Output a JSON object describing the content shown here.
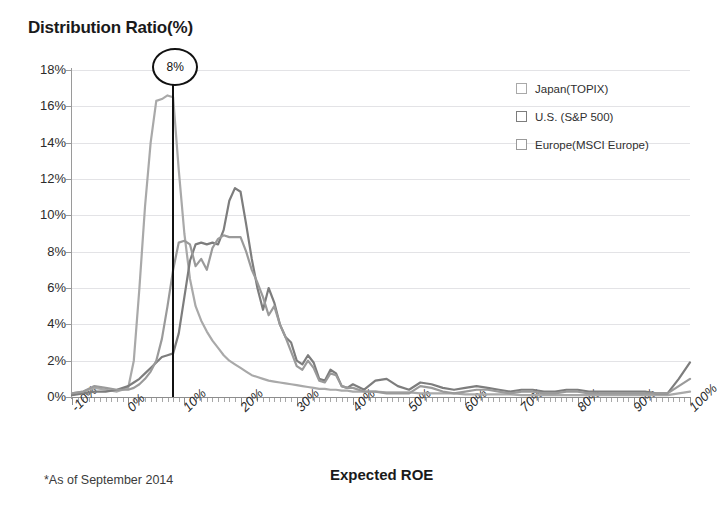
{
  "axes": {
    "y_title": "Distribution Ratio(%)",
    "x_title": "Expected ROE",
    "y_ticks": [
      "0%",
      "2%",
      "4%",
      "6%",
      "8%",
      "10%",
      "12%",
      "14%",
      "16%",
      "18%"
    ],
    "x_ticks": [
      "-10%",
      "0%",
      "10%",
      "20%",
      "30%",
      "40%",
      "50%",
      "60%",
      "70%",
      "80%",
      "90%",
      "100%"
    ]
  },
  "footnote": "*As of September 2014",
  "callout": {
    "label": "8%",
    "x_value": 8
  },
  "legend": {
    "items": [
      {
        "label": "Japan(TOPIX)",
        "color": "#a9a9a9"
      },
      {
        "label": "U.S. (S&P 500)",
        "color": "#7d7d7d"
      },
      {
        "label": "Europe(MSCI Europe)",
        "color": "#9a9a9a"
      }
    ]
  },
  "chart_data": {
    "type": "line",
    "title": "Distribution Ratio(%)",
    "xlabel": "Expected ROE",
    "ylabel": "Distribution Ratio(%)",
    "xlim": [
      -10,
      100
    ],
    "ylim": [
      0,
      18
    ],
    "grid": true,
    "legend_position": "top-right",
    "annotations": [
      {
        "text": "8%",
        "x": 8,
        "type": "vertical-line-callout"
      },
      {
        "text": "*As of September 2014",
        "type": "footnote"
      }
    ],
    "x": [
      -10,
      -8,
      -6,
      -4,
      -2,
      0,
      1,
      2,
      3,
      4,
      5,
      6,
      7,
      8,
      9,
      10,
      11,
      12,
      13,
      14,
      15,
      16,
      17,
      18,
      19,
      20,
      21,
      22,
      23,
      24,
      25,
      26,
      27,
      28,
      29,
      30,
      31,
      32,
      33,
      34,
      35,
      36,
      37,
      38,
      39,
      40,
      42,
      44,
      46,
      48,
      50,
      52,
      54,
      56,
      58,
      60,
      62,
      64,
      66,
      68,
      70,
      72,
      74,
      76,
      78,
      80,
      82,
      84,
      86,
      88,
      90,
      92,
      94,
      96,
      98,
      100
    ],
    "series": [
      {
        "name": "Japan(TOPIX)",
        "color": "#a9a9a9",
        "values": [
          0.2,
          0.3,
          0.5,
          0.4,
          0.3,
          0.5,
          2.0,
          6.0,
          10.5,
          14.0,
          16.3,
          16.4,
          16.6,
          16.5,
          12.5,
          9.0,
          6.5,
          5.0,
          4.2,
          3.6,
          3.1,
          2.7,
          2.3,
          2.0,
          1.8,
          1.6,
          1.4,
          1.2,
          1.1,
          1.0,
          0.9,
          0.85,
          0.8,
          0.75,
          0.7,
          0.65,
          0.6,
          0.55,
          0.5,
          0.45,
          0.45,
          0.4,
          0.4,
          0.35,
          0.35,
          0.3,
          0.3,
          0.3,
          0.25,
          0.25,
          0.25,
          0.2,
          0.2,
          0.2,
          0.2,
          0.15,
          0.15,
          0.15,
          0.15,
          0.15,
          0.1,
          0.1,
          0.1,
          0.1,
          0.1,
          0.1,
          0.1,
          0.1,
          0.1,
          0.1,
          0.1,
          0.1,
          0.1,
          0.1,
          0.2,
          0.3
        ]
      },
      {
        "name": "U.S. (S&P 500)",
        "color": "#7d7d7d",
        "values": [
          0.1,
          0.2,
          0.3,
          0.3,
          0.4,
          0.6,
          0.8,
          1.0,
          1.3,
          1.6,
          1.9,
          2.2,
          2.3,
          2.4,
          3.5,
          5.5,
          7.5,
          8.4,
          8.5,
          8.4,
          8.5,
          8.4,
          9.2,
          10.8,
          11.5,
          11.3,
          9.5,
          7.6,
          6.0,
          4.8,
          6.0,
          5.2,
          4.0,
          3.3,
          3.0,
          2.0,
          1.8,
          2.3,
          1.9,
          1.0,
          0.9,
          1.5,
          1.3,
          0.6,
          0.5,
          0.7,
          0.4,
          0.9,
          1.0,
          0.6,
          0.4,
          0.8,
          0.7,
          0.5,
          0.4,
          0.5,
          0.6,
          0.5,
          0.4,
          0.3,
          0.4,
          0.4,
          0.3,
          0.3,
          0.4,
          0.4,
          0.3,
          0.3,
          0.3,
          0.3,
          0.3,
          0.3,
          0.2,
          0.2,
          1.0,
          1.9
        ]
      },
      {
        "name": "Europe(MSCI Europe)",
        "color": "#9a9a9a",
        "values": [
          0.2,
          0.3,
          0.6,
          0.5,
          0.4,
          0.4,
          0.5,
          0.7,
          1.0,
          1.4,
          2.0,
          3.2,
          5.0,
          7.0,
          8.5,
          8.6,
          8.4,
          7.2,
          7.6,
          7.0,
          8.2,
          8.7,
          8.9,
          8.8,
          8.8,
          8.8,
          8.0,
          7.0,
          6.3,
          5.5,
          4.5,
          5.0,
          4.0,
          3.3,
          2.5,
          1.7,
          1.5,
          2.0,
          1.6,
          0.9,
          0.8,
          1.3,
          1.2,
          0.6,
          0.5,
          0.5,
          0.3,
          0.3,
          0.2,
          0.2,
          0.2,
          0.6,
          0.5,
          0.3,
          0.2,
          0.3,
          0.4,
          0.4,
          0.3,
          0.2,
          0.3,
          0.3,
          0.2,
          0.2,
          0.3,
          0.3,
          0.2,
          0.2,
          0.2,
          0.2,
          0.2,
          0.2,
          0.2,
          0.2,
          0.6,
          1.0
        ]
      }
    ]
  }
}
